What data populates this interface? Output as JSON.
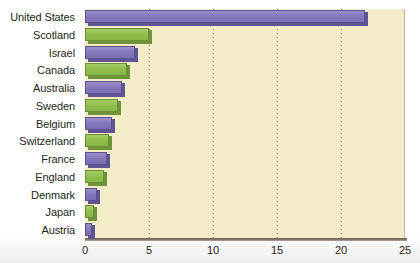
{
  "chart_data": {
    "type": "bar",
    "orientation": "horizontal",
    "title": "",
    "subtitle": "",
    "xlabel": "",
    "ylabel": "",
    "xlim": [
      0,
      25
    ],
    "xticks": [
      0,
      5,
      10,
      15,
      20,
      25
    ],
    "xticklabels": [
      "0",
      "5",
      "10",
      "15",
      "20",
      "25"
    ],
    "grid": "vertical-dotted",
    "legend": "none",
    "categories": [
      "United States",
      "Scotland",
      "Israel",
      "Canada",
      "Australia",
      "Sweden",
      "Belgium",
      "Switzerland",
      "France",
      "England",
      "Denmark",
      "Japan",
      "Austria"
    ],
    "values": [
      21.9,
      5.0,
      3.9,
      3.3,
      2.9,
      2.6,
      2.1,
      1.9,
      1.7,
      1.5,
      0.9,
      0.7,
      0.55
    ],
    "bar_colors": [
      "purple",
      "green",
      "purple",
      "green",
      "purple",
      "green",
      "purple",
      "green",
      "purple",
      "green",
      "purple",
      "green",
      "purple"
    ],
    "colors": {
      "purple": "#8879bd",
      "green": "#92c04f",
      "plot_background": "#f4ecc9",
      "gridline": "#8d8468",
      "axis": "#6b5a52",
      "text": "#231f20",
      "page_background": "#ffffff"
    }
  }
}
